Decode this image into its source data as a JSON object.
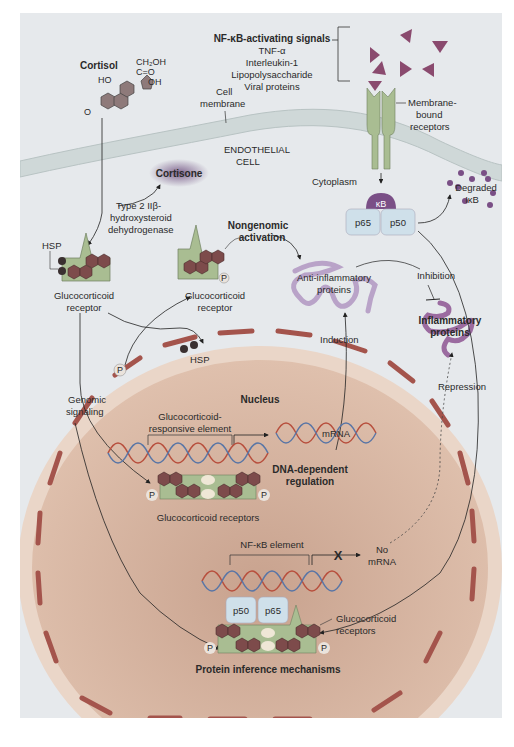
{
  "figure": {
    "colors": {
      "background": "#e6e9ec",
      "membrane": "#cdd6d6",
      "nucleus": "#dcb7a2",
      "nucleus_edge": "#e9d3c4",
      "envelope_segment": "#a4544c",
      "receptor": "#a9bd92",
      "hexagon": "#7d4b4b",
      "triangle": "#8a4a6e",
      "dna_a": "#b8503e",
      "dna_b": "#5a76a6",
      "subunit": "#cfe0ea",
      "kappa_b": "#7a4f86",
      "hsp": "#3a3030",
      "inflammatory": "#9b6ba0",
      "anti_inflammatory": "#b9a3c8",
      "cortisone_glow": "#7a5a88"
    },
    "extracellular": {
      "cortisol_label": "Cortisol",
      "cortisol_groups": {
        "ch2oh": "CH₂OH",
        "co": "C=O",
        "ho": "HO",
        "oh": "OH",
        "o": "O"
      },
      "cell_membrane_label_1": "Cell",
      "cell_membrane_label_2": "membrane",
      "signals_title": "NF-κB-activating signals",
      "signals": [
        "TNF-α",
        "Interleukin-1",
        "Lipopolysaccharide",
        "Viral proteins"
      ],
      "membrane_receptors_label": [
        "Membrane-",
        "bound",
        "receptors"
      ]
    },
    "cytoplasm": {
      "cell_label_1": "ENDOTHELIAL",
      "cell_label_2": "CELL",
      "cytoplasm_label": "Cytoplasm",
      "cortisone_label": "Cortisone",
      "enzyme_label": [
        "Type 2 IIβ-",
        "hydroxysteroid",
        "dehydrogenase"
      ],
      "hsp_label": "HSP",
      "gr_label_1": "Glucocorticoid",
      "gr_label_2": "receptor",
      "gr2_label_1": "Glucocorticoid",
      "gr2_label_2": "receptor",
      "phosphate": "P",
      "hsp_free_label": "HSP",
      "nongenomic_1": "Nongenomic",
      "nongenomic_2": "activation",
      "anti_inflammatory_1": "Anti-inflammatory",
      "anti_inflammatory_2": "proteins",
      "inhibition_label": "Inhibition",
      "inflammatory_1": "Inflammatory",
      "inflammatory_2": "proteins",
      "induction_label": "Induction",
      "repression_label": "Repression",
      "genomic_1": "Genomic",
      "genomic_2": "signaling",
      "kappa_b_label": "κB",
      "p65_label": "p65",
      "p50_label": "p50",
      "degraded_1": "Degraded",
      "degraded_2": "IκB"
    },
    "nucleus": {
      "title": "Nucleus",
      "gre_1": "Glucocorticoid-",
      "gre_2": "responsive element",
      "mrna_label": "mRNA",
      "dna_dependent_1": "DNA-dependent",
      "dna_dependent_2": "regulation",
      "gr_dimer_label": "Glucocorticoid receptors",
      "nfkb_element_label": "NF-κB element",
      "block_mark": "X",
      "no_mrna_1": "No",
      "no_mrna_2": "mRNA",
      "p50_label": "p50",
      "p65_label": "p65",
      "gr_label_1": "Glucocorticoid",
      "gr_label_2": "receptors",
      "phosphate": "P",
      "protein_interference_label": "Protein inference mechanisms"
    }
  }
}
